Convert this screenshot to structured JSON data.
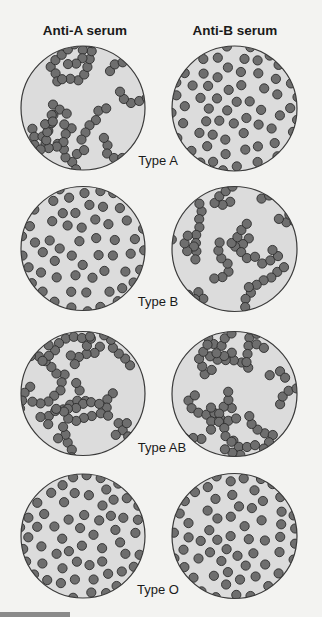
{
  "headers": {
    "anti_a": "Anti-A serum",
    "anti_b": "Anti-B serum"
  },
  "colors": {
    "plate_fill": "#dcdcdc",
    "plate_stroke": "#3a3a3a",
    "cell_fill": "#6e6e6e",
    "cell_stroke": "#2e2e2e"
  },
  "rows": [
    {
      "label": "Type A",
      "anti_a": {
        "agglutinated": true
      },
      "anti_b": {
        "agglutinated": false
      }
    },
    {
      "label": "Type B",
      "anti_a": {
        "agglutinated": false
      },
      "anti_b": {
        "agglutinated": true
      }
    },
    {
      "label": "Type AB",
      "anti_a": {
        "agglutinated": true
      },
      "anti_b": {
        "agglutinated": true
      }
    },
    {
      "label": "Type O",
      "anti_a": {
        "agglutinated": false
      },
      "anti_b": {
        "agglutinated": false
      }
    }
  ]
}
